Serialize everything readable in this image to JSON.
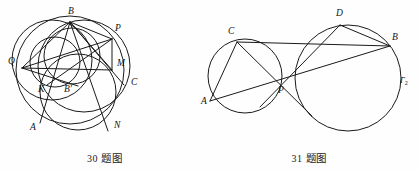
{
  "page": {
    "background_color": "#fefefe",
    "ink_color": "#1a1a1a",
    "width": 418,
    "height": 171
  },
  "figures": [
    {
      "id": "figure-30",
      "caption": "30 题图",
      "caption_number": "30",
      "caption_text": "题图",
      "description": "Configuration of several intersecting circles with labelled points",
      "point_labels": [
        {
          "name": "B",
          "text": "B",
          "x": 68,
          "y": 14
        },
        {
          "name": "P",
          "text": "P",
          "x": 115,
          "y": 31
        },
        {
          "name": "Q",
          "text": "Q",
          "x": 12,
          "y": 64
        },
        {
          "name": "M",
          "text": "M",
          "x": 117,
          "y": 66
        },
        {
          "name": "C",
          "text": "C",
          "x": 132,
          "y": 84
        },
        {
          "name": "K",
          "text": "K",
          "x": 42,
          "y": 91
        },
        {
          "name": "B-prime",
          "text": "B'",
          "x": 66,
          "y": 91
        },
        {
          "name": "A",
          "text": "A",
          "x": 33,
          "y": 128
        },
        {
          "name": "N",
          "text": "N",
          "x": 115,
          "y": 127
        }
      ],
      "circles": [
        {
          "name": "main-circumcircle",
          "cx": 70,
          "cy": 70,
          "r": 54
        },
        {
          "name": "circle-through-B-K-A",
          "cx": 52,
          "cy": 60,
          "r": 40
        },
        {
          "name": "lower-circle",
          "cx": 78,
          "cy": 92,
          "r": 38
        },
        {
          "name": "inner-circle-B-Bprime",
          "cx": 72,
          "cy": 56,
          "r": 28
        },
        {
          "name": "small-circle-Q-Bprime",
          "cx": 55,
          "cy": 62,
          "r": 25
        },
        {
          "name": "right-arc-circle",
          "cx": 84,
          "cy": 66,
          "r": 46
        }
      ],
      "segments": [
        {
          "name": "BQ",
          "x1": 70,
          "y1": 22,
          "x2": 22,
          "y2": 68
        },
        {
          "name": "BP",
          "x1": 70,
          "y1": 22,
          "x2": 112,
          "y2": 39
        },
        {
          "name": "BM",
          "x1": 70,
          "y1": 22,
          "x2": 112,
          "y2": 70
        },
        {
          "name": "BC",
          "x1": 70,
          "y1": 22,
          "x2": 124,
          "y2": 85
        },
        {
          "name": "BN",
          "x1": 70,
          "y1": 22,
          "x2": 108,
          "y2": 131
        },
        {
          "name": "BA",
          "x1": 70,
          "y1": 22,
          "x2": 40,
          "y2": 123
        },
        {
          "name": "QP",
          "x1": 22,
          "y1": 68,
          "x2": 112,
          "y2": 39
        },
        {
          "name": "QM",
          "x1": 22,
          "y1": 68,
          "x2": 112,
          "y2": 70
        },
        {
          "name": "QBprime",
          "x1": 22,
          "y1": 68,
          "x2": 74,
          "y2": 84
        },
        {
          "name": "PM",
          "x1": 112,
          "y1": 39,
          "x2": 112,
          "y2": 70
        },
        {
          "name": "PK",
          "x1": 112,
          "y1": 39,
          "x2": 49,
          "y2": 84
        }
      ]
    },
    {
      "id": "figure-31",
      "caption": "31 题图",
      "caption_number": "31",
      "caption_text": "题图",
      "description": "Two circles Gamma-1 and Gamma-2 meeting at P with lines CB and AD",
      "point_labels": [
        {
          "name": "D",
          "text": "D",
          "x": 139,
          "y": 16
        },
        {
          "name": "C",
          "text": "C",
          "x": 30,
          "y": 34
        },
        {
          "name": "B",
          "text": "B",
          "x": 188,
          "y": 39
        },
        {
          "name": "P",
          "text": "P",
          "x": 79,
          "y": 90
        },
        {
          "name": "A",
          "text": "A",
          "x": 2,
          "y": 101
        }
      ],
      "gamma_labels": [
        {
          "name": "gamma-1",
          "base": "Γ",
          "sub": "1",
          "x": -8,
          "y": 72
        },
        {
          "name": "gamma-2",
          "base": "Γ",
          "sub": "2",
          "x": 201,
          "y": 82
        }
      ],
      "circles": [
        {
          "name": "circle-gamma-1",
          "cx": 45,
          "cy": 76,
          "r": 37
        },
        {
          "name": "circle-gamma-2",
          "cx": 148,
          "cy": 78,
          "r": 53
        }
      ],
      "segments": [
        {
          "name": "CB",
          "x1": 37,
          "y1": 42,
          "x2": 190,
          "y2": 46
        },
        {
          "name": "AD",
          "x1": 10,
          "y1": 101,
          "x2": 140,
          "y2": 25
        },
        {
          "name": "CP-extended",
          "x1": 37,
          "y1": 42,
          "x2": 112,
          "y2": 115
        },
        {
          "name": "DP-extended",
          "x1": 140,
          "y1": 25,
          "x2": 62,
          "y2": 108
        },
        {
          "name": "AB-chord",
          "x1": 10,
          "y1": 101,
          "x2": 190,
          "y2": 46
        },
        {
          "name": "CA-chord",
          "x1": 37,
          "y1": 42,
          "x2": 10,
          "y2": 101
        },
        {
          "name": "DB-chord",
          "x1": 140,
          "y1": 25,
          "x2": 190,
          "y2": 46
        }
      ]
    }
  ]
}
